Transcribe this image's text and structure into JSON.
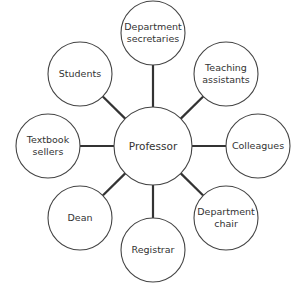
{
  "diagram": {
    "type": "hub-and-spoke",
    "colors": {
      "stroke": "#444444",
      "spoke": "#333333",
      "fill": "#ffffff",
      "text": "#333333"
    },
    "center": {
      "label": "Professor",
      "cx": 153,
      "cy": 146,
      "r": 39
    },
    "nodes": [
      {
        "label": "Department\nsecretaries",
        "cx": 153,
        "cy": 33,
        "r": 32
      },
      {
        "label": "Teaching\nassistants",
        "cx": 226,
        "cy": 74,
        "r": 32
      },
      {
        "label": "Colleagues",
        "cx": 258,
        "cy": 146,
        "r": 32
      },
      {
        "label": "Department\nchair",
        "cx": 226,
        "cy": 218,
        "r": 32
      },
      {
        "label": "Registrar",
        "cx": 153,
        "cy": 250,
        "r": 32
      },
      {
        "label": "Dean",
        "cx": 80,
        "cy": 218,
        "r": 32
      },
      {
        "label": "Textbook\nsellers",
        "cx": 48,
        "cy": 146,
        "r": 32
      },
      {
        "label": "Students",
        "cx": 80,
        "cy": 74,
        "r": 32
      }
    ]
  }
}
